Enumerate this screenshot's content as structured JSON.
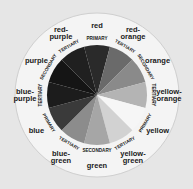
{
  "diagram": {
    "type": "color-wheel",
    "center": [
      97,
      95
    ],
    "wedges": [
      {
        "name": "red",
        "class": "PRIMARY",
        "shade": "#2a2a2a"
      },
      {
        "name": "red-orange",
        "class": "TERTIARY",
        "shade": "#6a6a6a"
      },
      {
        "name": "orange",
        "class": "SECONDARY",
        "shade": "#8a8a8a"
      },
      {
        "name": "yellow-orange",
        "class": "TERTIARY",
        "shade": "#b4b4b4"
      },
      {
        "name": "yellow",
        "class": "PRIMARY",
        "shade": "#f6f6f6"
      },
      {
        "name": "yellow-green",
        "class": "TERTIARY",
        "shade": "#d2d2d2"
      },
      {
        "name": "green",
        "class": "SECONDARY",
        "shade": "#a6a6a6"
      },
      {
        "name": "blue-green",
        "class": "TERTIARY",
        "shade": "#8c8c8c"
      },
      {
        "name": "blue",
        "class": "PRIMARY",
        "shade": "#3a3a3a"
      },
      {
        "name": "blue-purple",
        "class": "TERTIARY",
        "shade": "#1c1c1c"
      },
      {
        "name": "purple",
        "class": "SECONDARY",
        "shade": "#151515"
      },
      {
        "name": "red-purple",
        "class": "TERTIARY",
        "shade": "#202020"
      }
    ],
    "outer_labels": [
      [
        "red"
      ],
      [
        "red-",
        "orange"
      ],
      [
        "orange"
      ],
      [
        "yellow-",
        "orange"
      ],
      [
        "yellow"
      ],
      [
        "yellow-",
        "green"
      ],
      [
        "green"
      ],
      [
        "blue-",
        "green"
      ],
      [
        "blue"
      ],
      [
        "blue-",
        "purple"
      ],
      [
        "purple"
      ],
      [
        "red-",
        "purple"
      ]
    ]
  }
}
